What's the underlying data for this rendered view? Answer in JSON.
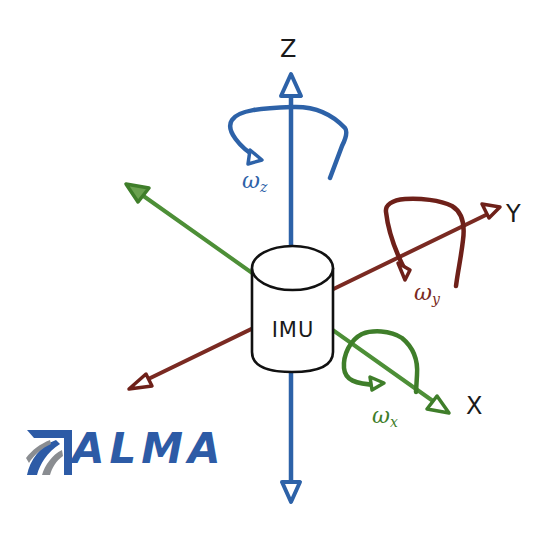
{
  "diagram": {
    "center_object": {
      "label": "IMU",
      "shape": "cylinder"
    },
    "axes": [
      {
        "name": "X",
        "label": "X",
        "color": "#3f8a2e",
        "angular_velocity": {
          "symbol": "ω",
          "subscript": "x",
          "color": "#3f8a2e"
        }
      },
      {
        "name": "Y",
        "label": "Y",
        "color": "#7a2a22",
        "angular_velocity": {
          "symbol": "ω",
          "subscript": "y",
          "color": "#7a2a22"
        }
      },
      {
        "name": "Z",
        "label": "Z",
        "color": "#2d62a8",
        "angular_velocity": {
          "symbol": "ω",
          "subscript": "z",
          "color": "#2d62a8"
        }
      }
    ]
  },
  "logo": {
    "text": "ALMA",
    "color": "#2d5ba6",
    "accent_color": "#8a8d91"
  }
}
